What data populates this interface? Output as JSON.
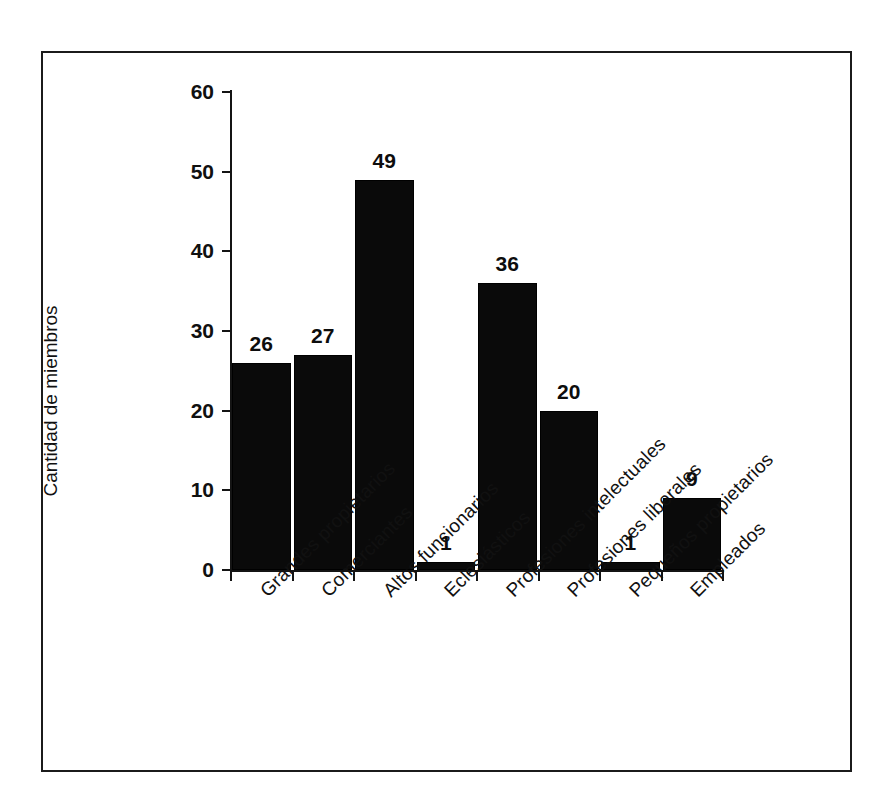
{
  "chart_data": {
    "type": "bar",
    "title": "",
    "subtitle": "",
    "xlabel": "",
    "ylabel": "Cantidad de miembros",
    "ylim": [
      0,
      60
    ],
    "yticks": [
      0,
      10,
      20,
      30,
      40,
      50,
      60
    ],
    "grid": false,
    "legend": null,
    "bar_color": "#0a0a0a",
    "categories": [
      "Grandes propietarios",
      "Comerciantes",
      "Altos funcionarios",
      "Eclesiásticos",
      "Profesiones intelectuales",
      "Profesiones liberales",
      "Pequeños propietarios",
      "Empleados"
    ],
    "values": [
      26,
      27,
      49,
      1,
      36,
      20,
      1,
      9
    ],
    "data_labels": [
      "26",
      "27",
      "49",
      "1",
      "36",
      "20",
      "1",
      "9"
    ],
    "ytick_labels": [
      "0",
      "10",
      "20",
      "30",
      "40",
      "50",
      "60"
    ]
  }
}
